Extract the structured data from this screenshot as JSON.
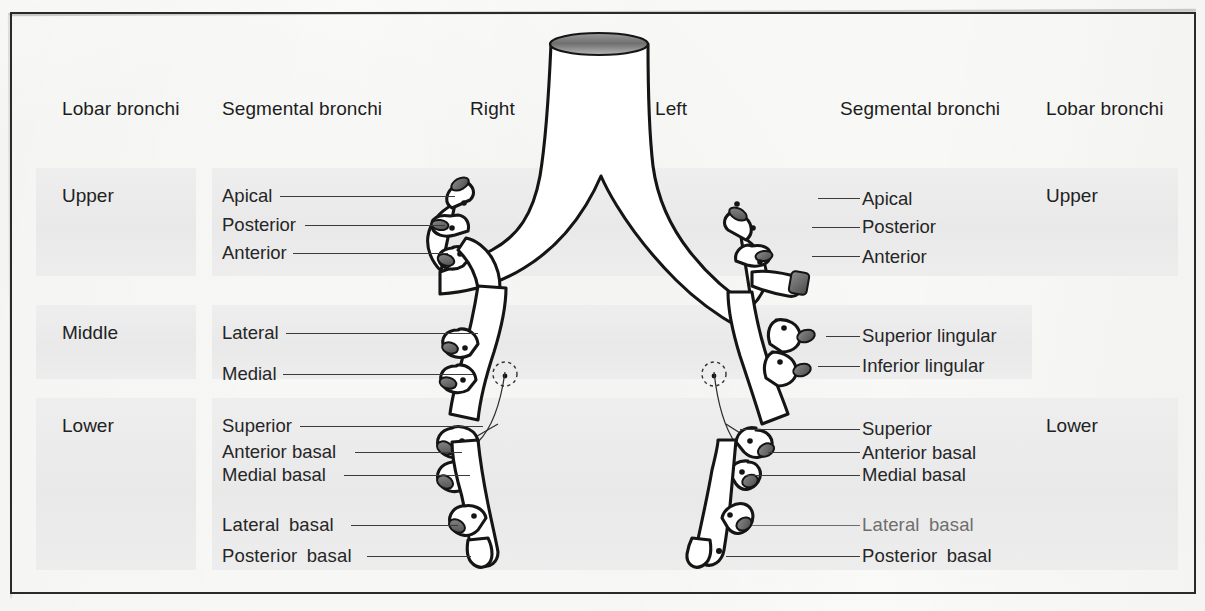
{
  "figure": {
    "frame_color": "#2a2a2a",
    "band_color": "#ececec"
  },
  "headers": [
    {
      "id": "lobar-left",
      "label": "Lobar bronchi",
      "x": 62,
      "y": 98
    },
    {
      "id": "segmental-left",
      "label": "Segmental bronchi",
      "x": 222,
      "y": 98
    },
    {
      "id": "side-right",
      "label": "Right",
      "x": 470,
      "y": 98
    },
    {
      "id": "side-left",
      "label": "Left",
      "x": 655,
      "y": 98
    },
    {
      "id": "segmental-right",
      "label": "Segmental bronchi",
      "x": 840,
      "y": 98
    },
    {
      "id": "lobar-right",
      "label": "Lobar bronchi",
      "x": 1046,
      "y": 98
    }
  ],
  "lobar_left": [
    {
      "label": "Upper",
      "x": 62,
      "y": 185
    },
    {
      "label": "Middle",
      "x": 62,
      "y": 322
    },
    {
      "label": "Lower",
      "x": 62,
      "y": 415
    }
  ],
  "lobar_right": [
    {
      "label": "Upper",
      "x": 1046,
      "y": 185
    },
    {
      "label": "Lower",
      "x": 1046,
      "y": 415
    }
  ],
  "segmental_left": [
    {
      "label": "Apical",
      "x": 222,
      "y": 185,
      "line": [
        280,
        196,
        175
      ],
      "wide": false,
      "faded": false
    },
    {
      "label": "Posterior",
      "x": 222,
      "y": 214,
      "line": [
        305,
        225,
        140
      ],
      "wide": false,
      "faded": false
    },
    {
      "label": "Anterior",
      "x": 222,
      "y": 242,
      "line": [
        293,
        253,
        155
      ],
      "wide": false,
      "faded": false
    },
    {
      "label": "Lateral",
      "x": 222,
      "y": 322,
      "line": [
        286,
        333,
        192
      ],
      "wide": false,
      "faded": false
    },
    {
      "label": "Medial",
      "x": 222,
      "y": 363,
      "line": [
        283,
        374,
        190
      ],
      "wide": false,
      "faded": false
    },
    {
      "label": "Superior",
      "x": 222,
      "y": 415,
      "line": [
        300,
        426,
        183
      ],
      "wide": false,
      "faded": false
    },
    {
      "label": "Anterior basal",
      "x": 222,
      "y": 441,
      "line": [
        355,
        452,
        107
      ],
      "wide": false,
      "faded": false
    },
    {
      "label": "Medial basal",
      "x": 222,
      "y": 464,
      "line": [
        344,
        475,
        126
      ],
      "wide": false,
      "faded": false
    },
    {
      "label": "Lateral  basal",
      "x": 222,
      "y": 514,
      "line": [
        351,
        525,
        107
      ],
      "wide": true,
      "faded": false
    },
    {
      "label": "Posterior  basal",
      "x": 222,
      "y": 545,
      "line": [
        367,
        556,
        104
      ],
      "wide": true,
      "faded": false
    }
  ],
  "segmental_right": [
    {
      "label": "Apical",
      "x": 862,
      "y": 188,
      "line": [
        818,
        198,
        42
      ],
      "wide": false,
      "faded": false
    },
    {
      "label": "Posterior",
      "x": 862,
      "y": 216,
      "line": [
        812,
        227,
        48
      ],
      "wide": false,
      "faded": false
    },
    {
      "label": "Anterior",
      "x": 862,
      "y": 246,
      "line": [
        812,
        256,
        48
      ],
      "wide": false,
      "faded": false
    },
    {
      "label": "Superior lingular",
      "x": 862,
      "y": 325,
      "line": [
        826,
        336,
        34
      ],
      "wide": false,
      "faded": false
    },
    {
      "label": "Inferior lingular",
      "x": 862,
      "y": 355,
      "line": [
        818,
        366,
        42
      ],
      "wide": false,
      "faded": false
    },
    {
      "label": "Superior",
      "x": 862,
      "y": 418,
      "line": [
        740,
        429,
        120
      ],
      "wide": false,
      "faded": false
    },
    {
      "label": "Anterior basal",
      "x": 862,
      "y": 442,
      "line": [
        768,
        452,
        92
      ],
      "wide": false,
      "faded": false
    },
    {
      "label": "Medial basal",
      "x": 862,
      "y": 464,
      "line": [
        746,
        475,
        114
      ],
      "wide": false,
      "faded": false
    },
    {
      "label": "Lateral  basal",
      "x": 862,
      "y": 514,
      "line": [
        752,
        525,
        108
      ],
      "wide": true,
      "faded": true
    },
    {
      "label": "Posterior  basal",
      "x": 862,
      "y": 545,
      "line": [
        726,
        556,
        134
      ],
      "wide": true,
      "faded": false
    }
  ],
  "bands": [
    {
      "id": "band-upper-left",
      "x": 36,
      "y": 168,
      "w": 160,
      "h": 108
    },
    {
      "id": "band-middle-left",
      "x": 36,
      "y": 305,
      "w": 160,
      "h": 74
    },
    {
      "id": "band-lower-left",
      "x": 36,
      "y": 398,
      "w": 160,
      "h": 172
    },
    {
      "id": "band-upper-mid",
      "x": 212,
      "y": 168,
      "w": 820,
      "h": 108
    },
    {
      "id": "band-middle-mid",
      "x": 212,
      "y": 305,
      "w": 820,
      "h": 74
    },
    {
      "id": "band-lower-mid",
      "x": 212,
      "y": 398,
      "w": 820,
      "h": 172
    },
    {
      "id": "band-upper-right",
      "x": 1032,
      "y": 168,
      "w": 146,
      "h": 108
    },
    {
      "id": "band-lower-right",
      "x": 1032,
      "y": 398,
      "w": 146,
      "h": 172
    }
  ]
}
